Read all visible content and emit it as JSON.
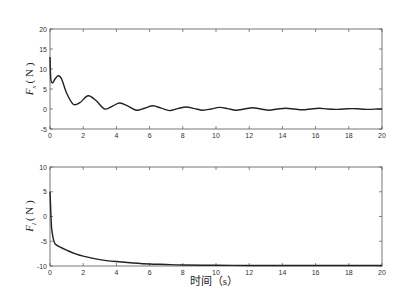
{
  "chart_data": [
    {
      "type": "line",
      "title": "",
      "xlabel": "",
      "ylabel": "F_x (N)",
      "ylabel_main": "F",
      "ylabel_sub": "x",
      "ylabel_unit": "( N )",
      "xlim": [
        0,
        20
      ],
      "ylim": [
        -5,
        20
      ],
      "xticks": [
        "0",
        "2",
        "4",
        "6",
        "8",
        "10",
        "12",
        "14",
        "16",
        "18",
        "20"
      ],
      "yticks": [
        "20",
        "15",
        "10",
        "5",
        "0",
        "-5"
      ],
      "grid": false,
      "series": [
        {
          "name": "F_x",
          "x": [
            0,
            0.05,
            0.15,
            0.3,
            0.5,
            0.7,
            1.0,
            1.4,
            1.8,
            2.3,
            2.8,
            3.3,
            3.8,
            4.2,
            4.7,
            5.2,
            5.7,
            6.2,
            6.7,
            7.2,
            7.7,
            8.2,
            8.7,
            9.2,
            9.7,
            10.2,
            10.7,
            11.2,
            11.7,
            12.2,
            12.7,
            13.2,
            13.7,
            14.2,
            14.7,
            15.2,
            15.7,
            16.2,
            16.7,
            17.2,
            17.7,
            18.2,
            18.7,
            19.2,
            19.7,
            20
          ],
          "values": [
            13,
            7.5,
            6.5,
            7.5,
            8.3,
            7.5,
            4,
            1.2,
            1.6,
            3.3,
            2,
            0,
            0.8,
            1.5,
            0.7,
            -0.3,
            0.2,
            0.8,
            0.2,
            -0.4,
            0.1,
            0.5,
            0.1,
            -0.3,
            0,
            0.4,
            0.1,
            -0.3,
            0,
            0.3,
            0,
            -0.3,
            0,
            0.2,
            0,
            -0.2,
            0,
            0.2,
            0,
            -0.1,
            0,
            0.1,
            0,
            -0.1,
            0,
            0
          ]
        }
      ]
    },
    {
      "type": "line",
      "title": "",
      "xlabel": "时间（s）",
      "ylabel": "F_l (N)",
      "ylabel_main": "F",
      "ylabel_sub": "l",
      "ylabel_unit": "( N )",
      "xlim": [
        0,
        20
      ],
      "ylim": [
        -10,
        10
      ],
      "xticks": [
        "0",
        "2",
        "4",
        "6",
        "8",
        "10",
        "12",
        "14",
        "16",
        "18",
        "20"
      ],
      "yticks": [
        "10",
        "5",
        "0",
        "-5",
        "-10"
      ],
      "grid": false,
      "series": [
        {
          "name": "F_l",
          "x": [
            0,
            0.05,
            0.1,
            0.2,
            0.3,
            0.5,
            1,
            1.5,
            2,
            3,
            4,
            5,
            6,
            7,
            8,
            10,
            12,
            14,
            16,
            18,
            20
          ],
          "values": [
            5,
            1,
            -2.5,
            -4.5,
            -5.5,
            -6.0,
            -6.8,
            -7.5,
            -8.0,
            -8.7,
            -9.1,
            -9.4,
            -9.6,
            -9.7,
            -9.8,
            -9.85,
            -9.9,
            -9.9,
            -9.9,
            -9.9,
            -9.9
          ]
        }
      ]
    }
  ]
}
